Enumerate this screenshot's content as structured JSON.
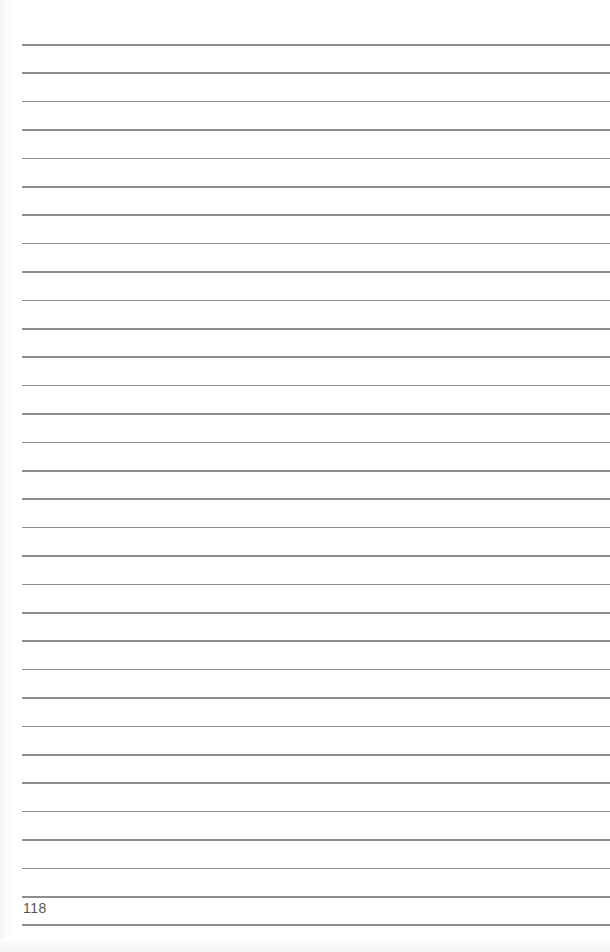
{
  "page": {
    "type": "lined notebook page",
    "page_number": "118",
    "rule_count": 32,
    "first_rule_y": 44,
    "rule_spacing": 28.4,
    "rule_color": "#8e8e8e",
    "background_color": "#ffffff"
  }
}
